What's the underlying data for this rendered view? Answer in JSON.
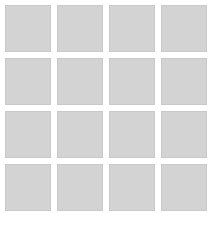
{
  "gallery": {
    "tile_color": "#d3d3d3",
    "rows": 4,
    "columns": 4,
    "tiles": [
      {
        "id": 1
      },
      {
        "id": 2
      },
      {
        "id": 3
      },
      {
        "id": 4
      },
      {
        "id": 5
      },
      {
        "id": 6
      },
      {
        "id": 7
      },
      {
        "id": 8
      },
      {
        "id": 9
      },
      {
        "id": 10
      },
      {
        "id": 11
      },
      {
        "id": 12
      },
      {
        "id": 13
      },
      {
        "id": 14
      },
      {
        "id": 15
      },
      {
        "id": 16
      }
    ],
    "bottom_labels": [
      "",
      "",
      "",
      ""
    ]
  }
}
